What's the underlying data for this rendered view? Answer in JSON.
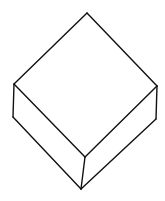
{
  "diagram": {
    "type": "isometric-box-sketch",
    "stroke_color": "#111111",
    "background_color": "#ffffff",
    "vertices": {
      "top": [
        87,
        13
      ],
      "left_top": [
        14,
        84
      ],
      "left_bottom": [
        13,
        117
      ],
      "right_top": [
        157,
        86
      ],
      "right_bottom": [
        156,
        119
      ],
      "front_top": [
        85,
        157
      ],
      "front_bottom": [
        81,
        189
      ]
    },
    "edges": [
      [
        "top",
        "left_top"
      ],
      [
        "top",
        "right_top"
      ],
      [
        "left_top",
        "front_top"
      ],
      [
        "right_top",
        "front_top"
      ],
      [
        "left_top",
        "left_bottom"
      ],
      [
        "right_top",
        "right_bottom"
      ],
      [
        "front_top",
        "front_bottom"
      ],
      [
        "left_bottom",
        "front_bottom"
      ],
      [
        "right_bottom",
        "front_bottom"
      ]
    ]
  }
}
